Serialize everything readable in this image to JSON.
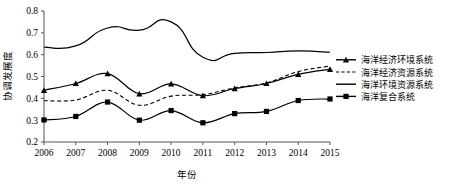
{
  "chart_data": {
    "type": "line",
    "title": "",
    "xlabel": "年份",
    "ylabel": "协调发展度",
    "grid": false,
    "legend_position": "right",
    "xlim": [
      2006,
      2015
    ],
    "ylim": [
      0.2,
      0.8
    ],
    "ytick_labels": [
      "0.8",
      "0.7",
      "0.6",
      "0.5",
      "0.4",
      "0.3",
      "0.2"
    ],
    "ytick_values": [
      0.8,
      0.7,
      0.6,
      0.5,
      0.4,
      0.3,
      0.2
    ],
    "categories": [
      2006,
      2007,
      2008,
      2009,
      2010,
      2011,
      2012,
      2013,
      2014,
      2015
    ],
    "xtick_labels": [
      "2006",
      "2007",
      "2008",
      "2009",
      "2010",
      "2011",
      "2012",
      "2013",
      "2014",
      "2015"
    ],
    "series": [
      {
        "name": "海洋经济环境系统",
        "marker": "triangle",
        "style": "solid",
        "values": [
          0.437,
          0.468,
          0.513,
          0.421,
          0.466,
          0.412,
          0.445,
          0.468,
          0.51,
          0.533
        ]
      },
      {
        "name": "海洋经济资源系统",
        "marker": "none",
        "style": "dashed",
        "values": [
          0.389,
          0.392,
          0.437,
          0.368,
          0.41,
          0.417,
          0.448,
          0.47,
          0.523,
          0.548
        ]
      },
      {
        "name": "海洋环境资源系统",
        "marker": "none",
        "style": "solid",
        "values": [
          0.634,
          0.64,
          0.722,
          0.712,
          0.75,
          0.588,
          0.606,
          0.61,
          0.617,
          0.611
        ]
      },
      {
        "name": "海洋复合系统",
        "marker": "square",
        "style": "solid",
        "values": [
          0.301,
          0.317,
          0.383,
          0.3,
          0.344,
          0.288,
          0.33,
          0.34,
          0.39,
          0.397
        ]
      }
    ]
  },
  "legend": {
    "items": [
      {
        "label": "海洋经济环境系统",
        "marker": "triangle",
        "style": "solid"
      },
      {
        "label": "海洋经济资源系统",
        "marker": "none",
        "style": "dashed"
      },
      {
        "label": "海洋环境资源系统",
        "marker": "none",
        "style": "solid"
      },
      {
        "label": "海洋复合系统",
        "marker": "square",
        "style": "solid"
      }
    ]
  },
  "colors": {
    "line": "#000000",
    "axis": "#555555",
    "background": "#ffffff"
  }
}
